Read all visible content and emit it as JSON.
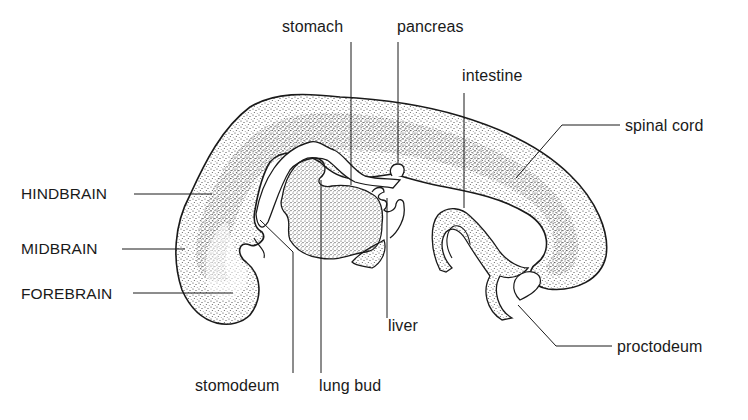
{
  "figure": {
    "colors": {
      "background": "#ffffff",
      "ink": "#1a1a1a",
      "stipple": "#3a3a3a"
    }
  },
  "labels": {
    "stomach": "stomach",
    "pancreas": "pancreas",
    "intestine": "intestine",
    "spinal_cord": "spinal cord",
    "hindbrain": "HINDBRAIN",
    "midbrain": "MIDBRAIN",
    "forebrain": "FOREBRAIN",
    "liver": "liver",
    "proctodeum": "proctodeum",
    "stomodeum": "stomodeum",
    "lung_bud": "lung bud"
  }
}
